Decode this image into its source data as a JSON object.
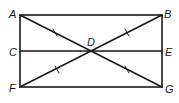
{
  "diagram": {
    "type": "geometry",
    "stroke_color": "#1a1a1a",
    "points": {
      "A": {
        "label": "A",
        "x": 20,
        "y": 15
      },
      "B": {
        "label": "B",
        "x": 162,
        "y": 15
      },
      "C": {
        "label": "C",
        "x": 20,
        "y": 51
      },
      "D": {
        "label": "D",
        "x": 91,
        "y": 51
      },
      "E": {
        "label": "E",
        "x": 162,
        "y": 51
      },
      "F": {
        "label": "F",
        "x": 20,
        "y": 87
      },
      "G": {
        "label": "G",
        "x": 162,
        "y": 87
      }
    },
    "segments": [
      [
        "A",
        "B"
      ],
      [
        "B",
        "G"
      ],
      [
        "G",
        "F"
      ],
      [
        "F",
        "A"
      ],
      [
        "A",
        "G"
      ],
      [
        "B",
        "F"
      ],
      [
        "C",
        "E"
      ]
    ],
    "tick_marks": [
      "AD",
      "BD",
      "FD",
      "GD"
    ]
  }
}
